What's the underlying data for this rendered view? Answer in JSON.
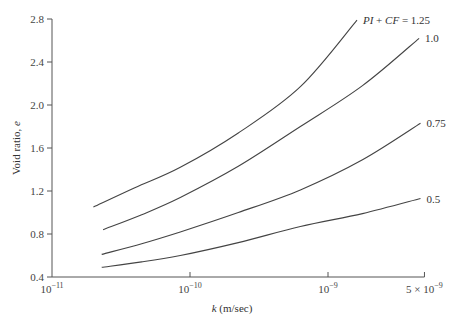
{
  "chart_data": {
    "type": "line",
    "title": "",
    "xlabel": "k (m/sec)",
    "xlabel_italic_part": "k",
    "xlabel_rest": " (m/sec)",
    "ylabel": "Void ratio, e",
    "ylabel_text": "Void ratio, ",
    "ylabel_italic_part": "e",
    "x_scale": "log",
    "xlim": [
      1e-11,
      5e-09
    ],
    "ylim": [
      0.4,
      2.8
    ],
    "grid": false,
    "x_ticks": [
      {
        "value": 1e-11,
        "label_base": "10",
        "label_exp": "−11"
      },
      {
        "value": 1e-10,
        "label_base": "10",
        "label_exp": "−10"
      },
      {
        "value": 1e-09,
        "label_base": "10",
        "label_exp": "−9"
      },
      {
        "value": 5e-09,
        "label_base": "5 × 10",
        "label_exp": "−9"
      }
    ],
    "y_ticks": [
      "0.4",
      "0.8",
      "1.2",
      "1.6",
      "2.0",
      "2.4",
      "2.8"
    ],
    "series": [
      {
        "name": "PI + CF = 1.25",
        "label": "PI + CF = 1.25",
        "log10_k": [
          -10.7,
          -10.4,
          -10.07,
          -9.65,
          -9.2,
          -8.79
        ],
        "e": [
          1.05,
          1.23,
          1.42,
          1.74,
          2.17,
          2.79
        ]
      },
      {
        "name": "1.0",
        "label": "1.0",
        "log10_k": [
          -10.63,
          -10.35,
          -10.07,
          -9.65,
          -9.2,
          -8.75,
          -8.34
        ],
        "e": [
          0.84,
          0.98,
          1.14,
          1.43,
          1.8,
          2.18,
          2.62
        ]
      },
      {
        "name": "0.75",
        "label": "0.75",
        "log10_k": [
          -10.64,
          -10.35,
          -10.07,
          -9.65,
          -9.2,
          -8.75,
          -8.33
        ],
        "e": [
          0.61,
          0.71,
          0.82,
          1.0,
          1.21,
          1.49,
          1.83
        ]
      },
      {
        "name": "0.5",
        "label": "0.5",
        "log10_k": [
          -10.64,
          -10.35,
          -10.07,
          -9.65,
          -9.2,
          -8.75,
          -8.33
        ],
        "e": [
          0.49,
          0.54,
          0.6,
          0.72,
          0.87,
          0.99,
          1.13
        ]
      }
    ],
    "annotations": [
      {
        "text": "PI + CF = 1.25",
        "attached_to": "PI + CF = 1.25"
      },
      {
        "text": "1.0",
        "attached_to": "1.0"
      },
      {
        "text": "0.75",
        "attached_to": "0.75"
      },
      {
        "text": "0.5",
        "attached_to": "0.5"
      }
    ]
  },
  "colors": {
    "axis": "#555555",
    "curve": "#444444",
    "text": "#333333"
  }
}
